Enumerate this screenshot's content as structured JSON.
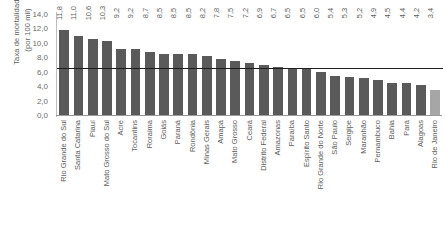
{
  "chart_data": {
    "type": "bar",
    "title": "",
    "subtitle": "",
    "xlabel": "",
    "ylabel": "Taxa de mortalidade (por 100 mil)",
    "ylabel_line1": "Taxa de mortalidade",
    "ylabel_line2": "(por 100 mil)",
    "ylim": [
      0,
      14
    ],
    "ytick_step": 2,
    "grid": false,
    "legend": "none",
    "decimal_separator": ",",
    "categories": [
      "Rio Grande do Sul",
      "Santa Catarina",
      "Piauí",
      "Mato Grosso do Sul",
      "Acre",
      "Tocantins",
      "Roraima",
      "Goiás",
      "Paraná",
      "Rondônia",
      "Minas Gerais",
      "Amapá",
      "Mato Grosso",
      "Ceará",
      "Distrito Federal",
      "Amazonas",
      "Paraíba",
      "Espírito Santo",
      "Rio Grande do Norte",
      "São Paulo",
      "Sergipe",
      "Maranhão",
      "Pernambuco",
      "Bahia",
      "Pará",
      "Alagoas",
      "Rio de Janeiro"
    ],
    "values": [
      11.8,
      11.0,
      10.6,
      10.3,
      9.2,
      9.2,
      8.7,
      8.5,
      8.5,
      8.5,
      8.2,
      7.8,
      7.5,
      7.2,
      6.9,
      6.7,
      6.5,
      6.5,
      6.0,
      5.4,
      5.3,
      5.2,
      4.9,
      4.5,
      4.4,
      4.2,
      3.4
    ],
    "value_labels": [
      "11,8",
      "11,0",
      "10,6",
      "10,3",
      "9,2",
      "9,2",
      "8,7",
      "8,5",
      "8,5",
      "8,5",
      "8,2",
      "7,8",
      "7,5",
      "7,2",
      "6,9",
      "6,7",
      "6,5",
      "6,5",
      "6,0",
      "5,4",
      "5,3",
      "5,2",
      "4,9",
      "4,5",
      "4,4",
      "4,2",
      "3,4"
    ],
    "ytick_labels": [
      "14,0",
      "12,0",
      "10,0",
      "8,0",
      "6,0",
      "4,0",
      "2,0",
      "0,0"
    ],
    "ytick_values": [
      14,
      12,
      10,
      8,
      6,
      4,
      2,
      0
    ],
    "reference_line": {
      "value": 6.5,
      "label": "",
      "color": "#1d1d1d"
    },
    "colors": {
      "bar": "#5a5a5a",
      "bar_light": "#a6a6a6",
      "axis": "#9a9a9a",
      "text": "#5d5d5d",
      "background": "#ffffff"
    },
    "highlight_last_index": 26
  }
}
